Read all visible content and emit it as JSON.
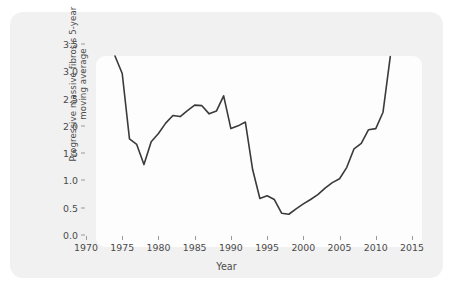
{
  "figure": {
    "background_color": "#ffffff",
    "card_color": "#f1f1f1",
    "panel_color": "#fdfdfd"
  },
  "chart_data": {
    "type": "line",
    "title": "",
    "xlabel": "Year",
    "ylabel": "Progressive massive fibrosis 5-year\nmoving average",
    "ylabel_line1": "Progressive massive fibrosis 5-year",
    "ylabel_line2": "moving average",
    "xlim": [
      1970,
      2015
    ],
    "ylim": [
      0.0,
      3.5
    ],
    "grid": false,
    "legend": "none",
    "line_color": "#3a3a3a",
    "line_width": 1.6,
    "xticks": [
      1970,
      1975,
      1980,
      1985,
      1990,
      1995,
      2000,
      2005,
      2010,
      2015
    ],
    "xticklabels": [
      "1970",
      "1975",
      "1980",
      "1985",
      "1990",
      "1995",
      "2000",
      "2005",
      "2010",
      "2015"
    ],
    "yticks": [
      0.0,
      0.5,
      1.0,
      1.5,
      2.0,
      2.5,
      3.0,
      3.5
    ],
    "yticklabels": [
      "0.0",
      "0.5",
      "1.0",
      "1.5",
      "2.0",
      "2.5",
      "3.0",
      "3.5"
    ],
    "series": [
      {
        "name": "Progressive massive fibrosis 5-year moving average",
        "x": [
          1974,
          1975,
          1976,
          1977,
          1978,
          1979,
          1980,
          1981,
          1982,
          1983,
          1984,
          1985,
          1986,
          1987,
          1988,
          1989,
          1990,
          1991,
          1992,
          1993,
          1994,
          1995,
          1996,
          1997,
          1998,
          1999,
          2000,
          2001,
          2002,
          2003,
          2004,
          2005,
          2006,
          2007,
          2008,
          2009,
          2010,
          2011,
          2012
        ],
        "y": [
          3.28,
          2.96,
          1.76,
          1.66,
          1.29,
          1.71,
          1.86,
          2.05,
          2.19,
          2.17,
          2.28,
          2.38,
          2.37,
          2.22,
          2.27,
          2.55,
          1.95,
          2.0,
          2.07,
          1.2,
          0.67,
          0.72,
          0.65,
          0.4,
          0.38,
          0.48,
          0.57,
          0.65,
          0.74,
          0.86,
          0.96,
          1.03,
          1.24,
          1.58,
          1.68,
          1.93,
          1.95,
          2.25,
          3.27
        ]
      }
    ]
  }
}
